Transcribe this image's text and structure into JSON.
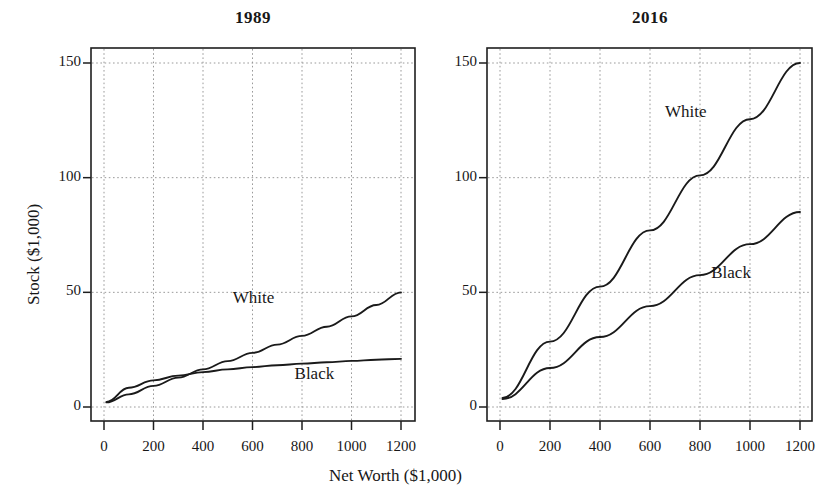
{
  "figure": {
    "background": "#ffffff",
    "ink_color": "#1a1a1a",
    "grid_color": "#9a9a9a",
    "xlabel": "Net Worth ($1,000)",
    "ylabel": "Stock ($1,000)"
  },
  "chart_data": [
    {
      "type": "line",
      "title": "1989",
      "xlabel": "Net Worth ($1,000)",
      "ylabel": "Stock ($1,000)",
      "xlim": [
        -60,
        1280
      ],
      "ylim": [
        -6,
        162
      ],
      "xticks": [
        0,
        200,
        400,
        600,
        800,
        1000,
        1200
      ],
      "xtick_labels": [
        "0",
        "200",
        "400",
        "600",
        "800",
        "1000",
        "1200"
      ],
      "yticks": [
        0,
        50,
        100,
        150
      ],
      "ytick_labels": [
        "0",
        "50",
        "100",
        "150"
      ],
      "grid": true,
      "legend": "inline-labels",
      "series": [
        {
          "name": "White",
          "label_position": {
            "x": 520,
            "y": 47
          },
          "x": [
            10,
            100,
            200,
            300,
            400,
            500,
            600,
            700,
            800,
            900,
            1000,
            1100,
            1200
          ],
          "values": [
            2.0,
            5.5,
            9.2,
            12.8,
            16.4,
            20.0,
            23.6,
            27.2,
            31.0,
            35.0,
            39.5,
            44.5,
            50.0
          ]
        },
        {
          "name": "Black",
          "label_position": {
            "x": 770,
            "y": 14
          },
          "x": [
            10,
            100,
            200,
            300,
            400,
            500,
            600,
            700,
            800,
            900,
            1000,
            1100,
            1200
          ],
          "values": [
            2.2,
            8.4,
            11.6,
            13.7,
            15.2,
            16.4,
            17.4,
            18.2,
            18.9,
            19.5,
            20.1,
            20.6,
            21.0
          ]
        }
      ]
    },
    {
      "type": "line",
      "title": "2016",
      "xlabel": "Net Worth ($1,000)",
      "ylabel": "Stock ($1,000)",
      "xlim": [
        -60,
        1280
      ],
      "ylim": [
        -6,
        162
      ],
      "xticks": [
        0,
        200,
        400,
        600,
        800,
        1000,
        1200
      ],
      "xtick_labels": [
        "0",
        "200",
        "400",
        "600",
        "800",
        "1000",
        "1200"
      ],
      "yticks": [
        0,
        50,
        100,
        150
      ],
      "ytick_labels": [
        "0",
        "50",
        "100",
        "150"
      ],
      "grid": true,
      "legend": "inline-labels",
      "series": [
        {
          "name": "White",
          "label_position": {
            "x": 660,
            "y": 128
          },
          "x": [
            10,
            200,
            400,
            600,
            800,
            1000,
            1200
          ],
          "values": [
            4.0,
            28.5,
            52.5,
            77.0,
            101.0,
            125.5,
            150.0
          ]
        },
        {
          "name": "Black",
          "label_position": {
            "x": 845,
            "y": 58
          },
          "x": [
            10,
            200,
            400,
            600,
            800,
            1000,
            1200
          ],
          "values": [
            3.5,
            17.0,
            30.5,
            44.0,
            57.5,
            71.0,
            85.0
          ]
        }
      ]
    }
  ],
  "panels": [
    {
      "title": "1989",
      "series_labels": [
        {
          "name": "White",
          "text": "White"
        },
        {
          "name": "Black",
          "text": "Black"
        }
      ]
    },
    {
      "title": "2016",
      "series_labels": [
        {
          "name": "White",
          "text": "White"
        },
        {
          "name": "Black",
          "text": "Black"
        }
      ]
    }
  ]
}
